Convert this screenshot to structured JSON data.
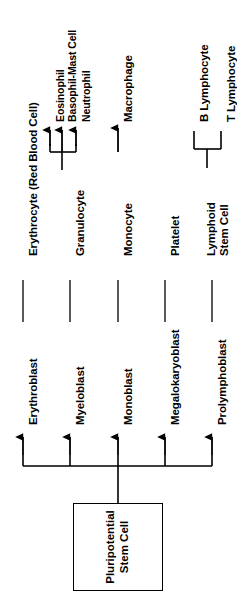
{
  "figure": {
    "orientation": "rotated-90-ccw",
    "line_color": "#000000",
    "background_color": "#ffffff",
    "text_color": "#000000"
  },
  "root": {
    "label_line1": "Pluripotential",
    "label_line2": "Stem Cell",
    "label": "Pluripotential Stem Cell"
  },
  "lineages": [
    {
      "blast": "Erythroblast",
      "mature": "Erythrocyte (Red Blood Cell)",
      "terminals": []
    },
    {
      "blast": "Myeloblast",
      "mature": "Granulocyte",
      "terminals": [
        "Eosinophil",
        "Basophil-Mast Cell",
        "Neutrophil"
      ]
    },
    {
      "blast": "Monoblast",
      "mature": "Monocyte",
      "terminals": [
        "Macrophage"
      ]
    },
    {
      "blast": "Megalokaryoblast",
      "mature": "Platelet",
      "terminals": []
    },
    {
      "blast": "Prolymphoblast",
      "mature": "Lymphoid Stem Cell",
      "mature_line1": "Lymphoid",
      "mature_line2": "Stem Cell",
      "terminals": [
        "B Lymphocyte",
        "T Lymphocyte"
      ]
    }
  ],
  "labels": {
    "erythrocyte": "Erythrocyte (Red Blood Cell)",
    "erythroblast": "Erythroblast",
    "granulocyte": "Granulocyte",
    "myeloblast": "Myeloblast",
    "eosinophil": "Eosinophil",
    "basophil_mast_cell": "Basophil-Mast Cell",
    "neutrophil": "Neutrophil",
    "monocyte": "Monocyte",
    "monoblast": "Monoblast",
    "macrophage": "Macrophage",
    "platelet": "Platelet",
    "megalokaryoblast": "Megalokaryoblast",
    "prolymphoblast": "Prolymphoblast",
    "lymphoid_stem_cell_line1": "Lymphoid",
    "lymphoid_stem_cell_line2": "Stem Cell",
    "b_lymphocyte": "B Lymphocyte",
    "t_lymphocyte": "T Lymphocyte",
    "stem_cell_line1": "Pluripotential",
    "stem_cell_line2": "Stem Cell"
  }
}
